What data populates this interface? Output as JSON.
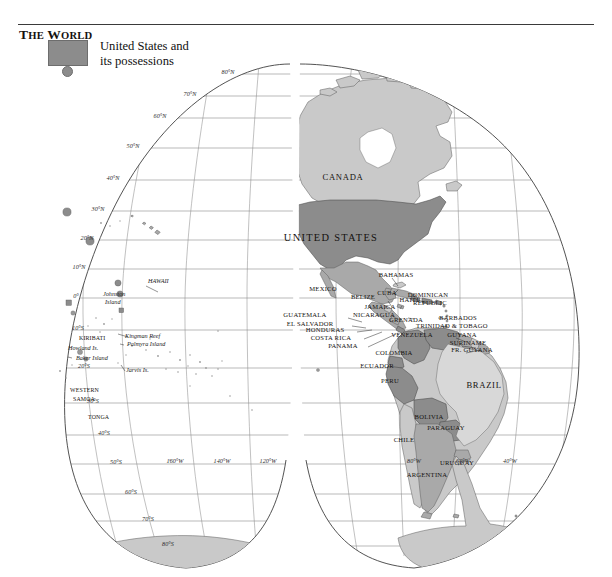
{
  "title": {
    "the": "THE",
    "world": "WORLD",
    "full": "THE WORLD"
  },
  "legend": {
    "swatch_color": "#8c8c8c",
    "line1": "United States and",
    "line2": "its possessions",
    "full": "United States and its possessions"
  },
  "map": {
    "projection": "interrupted homolosine",
    "hemisphere": "Western",
    "colors": {
      "us_fill": "#8c8c8c",
      "land_mid": "#a9a9a9",
      "land_plain": "#c9c9c9",
      "land_light": "#d8d8d8",
      "graticule": "#8e8e8e",
      "outline": "#4a4a4a",
      "background": "#ffffff"
    }
  },
  "graticule": {
    "latitudes": [
      {
        "label": "80°N",
        "x": 228,
        "y": 74
      },
      {
        "label": "70°N",
        "x": 190,
        "y": 96
      },
      {
        "label": "60°N",
        "x": 160,
        "y": 118
      },
      {
        "label": "50°N",
        "x": 133,
        "y": 148
      },
      {
        "label": "40°N",
        "x": 113,
        "y": 180
      },
      {
        "label": "30°N",
        "x": 98,
        "y": 211
      },
      {
        "label": "20°N",
        "x": 87,
        "y": 240
      },
      {
        "label": "10°N",
        "x": 79,
        "y": 269
      },
      {
        "label": "0°",
        "x": 76,
        "y": 298
      },
      {
        "label": "10°S",
        "x": 78,
        "y": 330
      },
      {
        "label": "20°S",
        "x": 84,
        "y": 368
      },
      {
        "label": "30°S",
        "x": 93,
        "y": 403
      },
      {
        "label": "40°S",
        "x": 104,
        "y": 435
      },
      {
        "label": "50°S",
        "x": 116,
        "y": 464
      },
      {
        "label": "60°S",
        "x": 131,
        "y": 494
      },
      {
        "label": "70°S",
        "x": 148,
        "y": 521
      },
      {
        "label": "80°S",
        "x": 168,
        "y": 546
      }
    ],
    "longitudes": [
      {
        "label": "160°W",
        "x": 175,
        "y": 463
      },
      {
        "label": "140°W",
        "x": 222,
        "y": 463
      },
      {
        "label": "120°W",
        "x": 268,
        "y": 463
      },
      {
        "label": "80°W",
        "x": 414,
        "y": 463
      },
      {
        "label": "60°W",
        "x": 463,
        "y": 463
      },
      {
        "label": "40°W",
        "x": 510,
        "y": 463
      }
    ]
  },
  "labels": {
    "major": [
      {
        "text": "CANADA",
        "x": 343,
        "y": 124,
        "cls": "lbl-med"
      },
      {
        "text": "UNITED STATES",
        "x": 331,
        "y": 185,
        "cls": "lbl-big"
      },
      {
        "text": "BRAZIL",
        "x": 484,
        "y": 332,
        "cls": "lbl-med"
      },
      {
        "text": "MEXICO",
        "x": 323,
        "y": 235,
        "cls": "lbl-small"
      }
    ],
    "countries": [
      {
        "text": "BAHAMAS",
        "x": 396,
        "y": 221
      },
      {
        "text": "CUBA",
        "x": 387,
        "y": 239
      },
      {
        "text": "HAITI",
        "x": 409,
        "y": 246
      },
      {
        "text": "DOMINICAN",
        "x": 428,
        "y": 241
      },
      {
        "text": "REPUBLIC",
        "x": 430,
        "y": 249
      },
      {
        "text": "BELIZE",
        "x": 363,
        "y": 243
      },
      {
        "text": "JAMAICA",
        "x": 380,
        "y": 253
      },
      {
        "text": "NICARAGUA",
        "x": 374,
        "y": 261
      },
      {
        "text": "GUATEMALA",
        "x": 305,
        "y": 261
      },
      {
        "text": "EL SALVADOR",
        "x": 310,
        "y": 270
      },
      {
        "text": "HONDURAS",
        "x": 325,
        "y": 276
      },
      {
        "text": "COSTA RICA",
        "x": 331,
        "y": 284
      },
      {
        "text": "PANAMA",
        "x": 343,
        "y": 292
      },
      {
        "text": "GRENADA",
        "x": 406,
        "y": 266
      },
      {
        "text": "BARBADOS",
        "x": 458,
        "y": 264
      },
      {
        "text": "TRINIDAD & TOBAGO",
        "x": 452,
        "y": 272
      },
      {
        "text": "GUYANA",
        "x": 462,
        "y": 281
      },
      {
        "text": "SURINAME",
        "x": 468,
        "y": 289
      },
      {
        "text": "FR. GUYANA",
        "x": 472,
        "y": 296
      },
      {
        "text": "VENEZUELA",
        "x": 412,
        "y": 281
      },
      {
        "text": "COLOMBIA",
        "x": 394,
        "y": 299
      },
      {
        "text": "ECUADOR",
        "x": 377,
        "y": 312
      },
      {
        "text": "PERU",
        "x": 390,
        "y": 327
      },
      {
        "text": "BOLIVIA",
        "x": 429,
        "y": 363
      },
      {
        "text": "PARAGUAY",
        "x": 446,
        "y": 374
      },
      {
        "text": "CHILE",
        "x": 404,
        "y": 386
      },
      {
        "text": "URUGUAY",
        "x": 457,
        "y": 409
      },
      {
        "text": "ARGENTINA",
        "x": 427,
        "y": 421
      }
    ],
    "pacific": [
      {
        "text": "HAWAII",
        "x": 148,
        "y": 227,
        "style": "isl"
      },
      {
        "text": "Johnston",
        "x": 103,
        "y": 240,
        "style": "isl"
      },
      {
        "text": "Island",
        "x": 105,
        "y": 248,
        "style": "isl"
      },
      {
        "text": "KIRIBATI",
        "x": 79,
        "y": 284,
        "style": "plain"
      },
      {
        "text": "Kingman Reef",
        "x": 125,
        "y": 282,
        "style": "isl"
      },
      {
        "text": "Palmyra Island",
        "x": 127,
        "y": 290,
        "style": "isl"
      },
      {
        "text": "Howland Is.",
        "x": 68,
        "y": 294,
        "style": "isl"
      },
      {
        "text": "Baker Island",
        "x": 76,
        "y": 304,
        "style": "isl"
      },
      {
        "text": "Jarvis  Is.",
        "x": 126,
        "y": 316,
        "style": "isl"
      },
      {
        "text": "WESTERN",
        "x": 70,
        "y": 336,
        "style": "plain"
      },
      {
        "text": "SAMOA",
        "x": 73,
        "y": 345,
        "style": "plain"
      },
      {
        "text": "TONGA",
        "x": 88,
        "y": 363,
        "style": "plain"
      }
    ]
  }
}
